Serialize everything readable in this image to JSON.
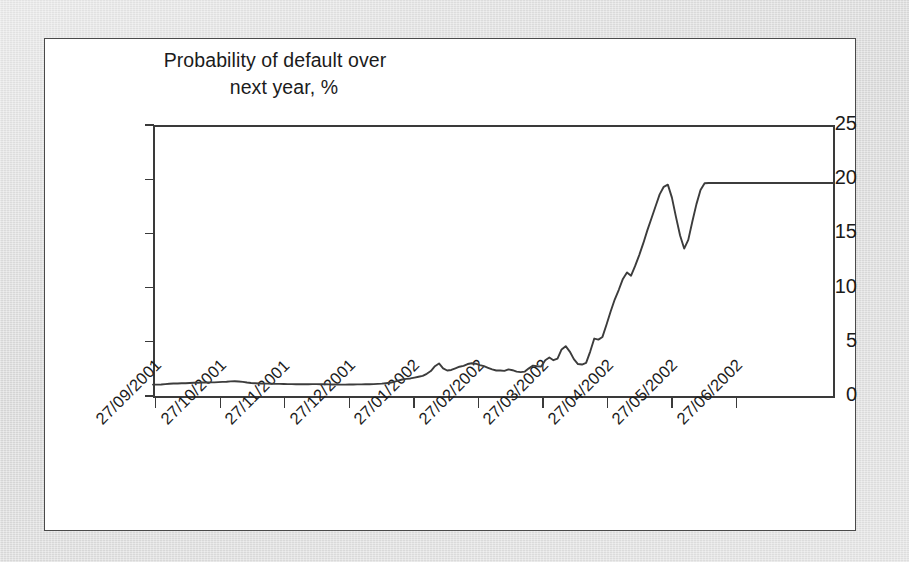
{
  "figure": {
    "panel_background": "#ffffff",
    "outer_background": "#d9d9d9",
    "border_color": "#4a4a4a"
  },
  "chart_data": {
    "type": "line",
    "title": "Probability of default over next year, %",
    "title_line_1": "Probability of default over",
    "title_line_2": "next year, %",
    "xlabel": "",
    "ylabel": "Probability of default over next year, %",
    "ylim": [
      0,
      25
    ],
    "yticks": [
      0,
      5,
      10,
      15,
      20,
      25
    ],
    "ytick_labels": [
      "0",
      "5",
      "10",
      "15",
      "20",
      "25"
    ],
    "grid": false,
    "legend": null,
    "line_color": "#3c3c3c",
    "x_tick_labels": [
      "27/09/2001",
      "27/10/2001",
      "27/11/2001",
      "27/12/2001",
      "27/01/2002",
      "27/02/2002",
      "27/03/2002",
      "27/04/2002",
      "27/05/2002",
      "27/06/2002"
    ],
    "x_domain": [
      "27/09/2001",
      "27/07/2002"
    ],
    "series": [
      {
        "name": "Probability of default over next year",
        "units": "%",
        "x": [
          0.0,
          0.6,
          1.2,
          1.8,
          2.4,
          3.0,
          3.6,
          4.2,
          4.8,
          5.4,
          6.0,
          6.6,
          7.2,
          7.8,
          8.4,
          9.0,
          9.6,
          10.2,
          10.8,
          11.4,
          12.0,
          12.6,
          13.2,
          13.8,
          14.4,
          15.0,
          15.6,
          16.2,
          16.8,
          17.4,
          18.0,
          18.6,
          19.2,
          19.8,
          20.4,
          21.0,
          21.6,
          22.2,
          22.8,
          23.4,
          24.0,
          24.6,
          25.2,
          25.8,
          26.4,
          27.0,
          27.6,
          28.2,
          28.8,
          29.4,
          30.0,
          30.6,
          31.2,
          31.8,
          32.4,
          33.0,
          33.6,
          34.2,
          34.8,
          35.4,
          36.0,
          36.6,
          37.2,
          37.8,
          38.4,
          39.0,
          39.6,
          40.2,
          40.8,
          41.4,
          42.0,
          42.6,
          43.2,
          43.8,
          44.4,
          45.0,
          45.6,
          46.2,
          46.8,
          47.4,
          48.0,
          48.6,
          49.2,
          49.8,
          50.4,
          51.0,
          51.6,
          52.2,
          52.8,
          53.4,
          54.0,
          54.6,
          55.2,
          55.8,
          56.4,
          57.0,
          57.6,
          58.2,
          58.8,
          59.4,
          60.0,
          60.6,
          61.2,
          61.8,
          62.4,
          63.0,
          63.6,
          64.2,
          64.8,
          65.4,
          66.0,
          66.6,
          67.2,
          67.8,
          68.4,
          69.0,
          69.6,
          70.2,
          70.8,
          71.4,
          72.0,
          72.6,
          73.2,
          73.8,
          74.4,
          75.0,
          75.6,
          76.2,
          76.8,
          77.4,
          78.0,
          78.6,
          79.2,
          79.8,
          80.4,
          81.0,
          81.6,
          82.2,
          82.8,
          83.4,
          84.0,
          85.0,
          86.0,
          87.0,
          88.0,
          89.0,
          90.0,
          92.0,
          94.0,
          96.0,
          98.0,
          100.0
        ],
        "y": [
          1.05,
          1.05,
          1.06,
          1.1,
          1.13,
          1.15,
          1.16,
          1.18,
          1.18,
          1.2,
          1.22,
          1.22,
          1.24,
          1.25,
          1.26,
          1.26,
          1.28,
          1.3,
          1.32,
          1.35,
          1.36,
          1.34,
          1.3,
          1.24,
          1.2,
          1.18,
          1.16,
          1.14,
          1.14,
          1.13,
          1.12,
          1.12,
          1.11,
          1.1,
          1.1,
          1.09,
          1.08,
          1.08,
          1.09,
          1.1,
          1.1,
          1.09,
          1.08,
          1.07,
          1.06,
          1.06,
          1.05,
          1.05,
          1.06,
          1.06,
          1.07,
          1.07,
          1.08,
          1.09,
          1.1,
          1.12,
          1.14,
          1.18,
          1.22,
          1.3,
          1.42,
          1.52,
          1.58,
          1.62,
          1.7,
          1.78,
          1.86,
          2.05,
          2.3,
          2.75,
          3.0,
          2.55,
          2.35,
          2.4,
          2.55,
          2.7,
          2.78,
          2.95,
          3.02,
          2.98,
          2.85,
          2.75,
          2.6,
          2.45,
          2.35,
          2.35,
          2.32,
          2.45,
          2.38,
          2.25,
          2.2,
          2.25,
          2.55,
          2.8,
          2.75,
          2.72,
          3.3,
          3.55,
          3.3,
          3.45,
          4.3,
          4.6,
          4.1,
          3.4,
          2.95,
          2.9,
          3.05,
          4.1,
          5.3,
          5.2,
          5.45,
          6.6,
          7.8,
          8.9,
          9.8,
          10.8,
          11.4,
          11.1,
          12.0,
          13.0,
          14.1,
          15.3,
          16.4,
          17.5,
          18.6,
          19.3,
          19.5,
          18.3,
          16.5,
          14.8,
          13.6,
          14.4,
          16.1,
          17.7,
          19.0,
          19.62,
          19.65,
          19.65,
          19.65,
          19.65,
          19.65,
          19.65,
          19.65,
          19.65,
          19.65,
          19.65,
          19.65,
          19.65,
          19.65,
          19.65,
          19.65,
          19.65
        ]
      }
    ]
  }
}
